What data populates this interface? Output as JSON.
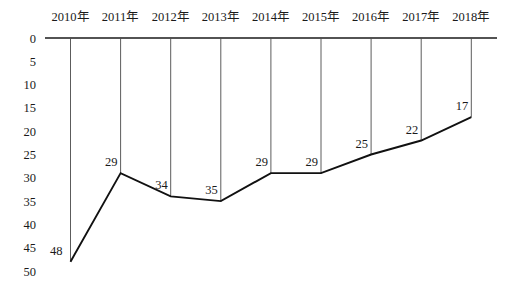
{
  "chart_data": {
    "type": "line",
    "title": "",
    "xlabel": "",
    "ylabel": "",
    "categories": [
      "2010年",
      "2011年",
      "2012年",
      "2013年",
      "2014年",
      "2015年",
      "2016年",
      "2017年",
      "2018年"
    ],
    "values": [
      48,
      29,
      34,
      35,
      29,
      29,
      25,
      22,
      17
    ],
    "data_labels_shown": true,
    "y_ticks": [
      0,
      5,
      10,
      15,
      20,
      25,
      30,
      35,
      40,
      45,
      50
    ],
    "ylim": [
      0,
      50
    ],
    "y_axis_inverted": true,
    "x_axis_position": "top",
    "grid": "vertical-drop-lines-from-zero-axis",
    "legend": "none",
    "colors": {
      "background": "#ffffff",
      "axis_line": "#1a1a1a",
      "drop_line": "#4a4a4a",
      "data_line": "#111111",
      "text": "#1a1a1a"
    }
  }
}
